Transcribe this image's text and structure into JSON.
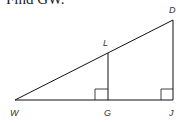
{
  "prompt": "Find GW.",
  "diagram": {
    "points": {
      "W": {
        "label": "W",
        "x": 15,
        "y": 100
      },
      "G": {
        "label": "G",
        "x": 108,
        "y": 100
      },
      "J": {
        "label": "J",
        "x": 173,
        "y": 100
      },
      "D": {
        "label": "D",
        "x": 173,
        "y": 20
      },
      "L": {
        "label": "L",
        "x": 108,
        "y": 53
      }
    },
    "segments": [
      "WJ",
      "WD",
      "DJ",
      "LG"
    ],
    "right_angles": [
      "G",
      "J"
    ],
    "line_color": "#111111"
  }
}
